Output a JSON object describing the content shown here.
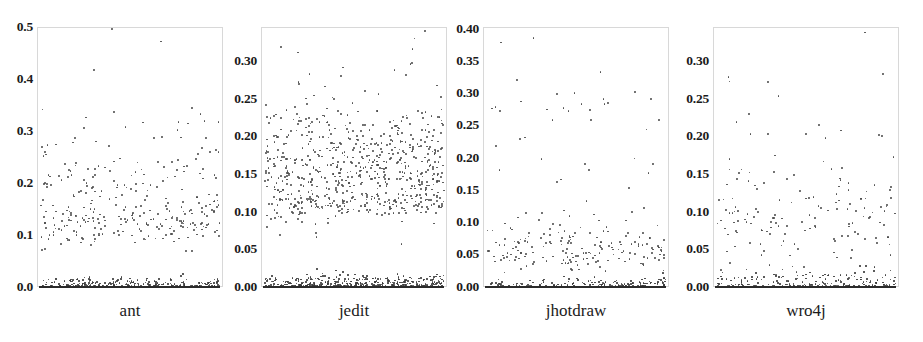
{
  "figure": {
    "background_color": "#ffffff",
    "dot_color": "#4a4a4a",
    "frame_color": "#d8d8d8",
    "width": 923,
    "height": 342
  },
  "chart_data": [
    {
      "type": "scatter",
      "title": "ant",
      "xlabel": "ant",
      "ylabel": "",
      "grid": false,
      "legend": null,
      "ylim": [
        0.0,
        0.5
      ],
      "yticks": [
        "0.0",
        "0.1",
        "0.2",
        "0.3",
        "0.4",
        "0.5"
      ],
      "ytick_values": [
        0.0,
        0.1,
        0.2,
        0.3,
        0.4,
        0.5
      ],
      "xlim": [
        0,
        1
      ],
      "xticks": [],
      "n_points": 640,
      "description": "Dense band of points near y=0.00 spanning full width, a secondary band around y=0.11-0.14, scattered points from 0.15 to 0.30, outliers at 0.35 and 0.49",
      "clusters": [
        {
          "center_y": 0.004,
          "spread_y": 0.008,
          "count": 330,
          "note": "zero baseline band"
        },
        {
          "center_y": 0.125,
          "spread_y": 0.022,
          "count": 160,
          "note": "mid band"
        },
        {
          "center_y": 0.2,
          "spread_y": 0.045,
          "count": 120,
          "note": "upper scatter"
        },
        {
          "center_y": 0.29,
          "spread_y": 0.035,
          "count": 22,
          "note": "sparse upper"
        },
        {
          "center_y": 0.42,
          "spread_y": 0.07,
          "count": 3,
          "note": "outliers"
        }
      ],
      "max_value": 0.49
    },
    {
      "type": "scatter",
      "title": "jedit",
      "xlabel": "jedit",
      "ylabel": "",
      "grid": false,
      "legend": null,
      "ylim": [
        0.0,
        0.33
      ],
      "yticks": [
        "0.00",
        "0.05",
        "0.10",
        "0.15",
        "0.20",
        "0.25",
        "0.30"
      ],
      "ytick_values": [
        0.0,
        0.05,
        0.1,
        0.15,
        0.2,
        0.25,
        0.3
      ],
      "xlim": [
        0,
        1
      ],
      "xticks": [],
      "n_points": 1150,
      "description": "Very dense baseline at y=0.00, heavy cloud from 0.08 to 0.21 centered near 0.145, a dense sub-band at 0.105, sparse outliers to 0.32",
      "clusters": [
        {
          "center_y": 0.004,
          "spread_y": 0.006,
          "count": 430,
          "note": "zero baseline band"
        },
        {
          "center_y": 0.105,
          "spread_y": 0.008,
          "count": 150,
          "note": "dense lower band"
        },
        {
          "center_y": 0.148,
          "spread_y": 0.028,
          "count": 440,
          "note": "main cloud"
        },
        {
          "center_y": 0.2,
          "spread_y": 0.022,
          "count": 110,
          "note": "upper cloud"
        },
        {
          "center_y": 0.26,
          "spread_y": 0.035,
          "count": 18,
          "note": "sparse upper"
        },
        {
          "center_y": 0.315,
          "spread_y": 0.01,
          "count": 3,
          "note": "outliers"
        }
      ],
      "max_value": 0.325
    },
    {
      "type": "scatter",
      "title": "jhotdraw",
      "xlabel": "jhotdraw",
      "ylabel": "",
      "grid": false,
      "legend": null,
      "ylim": [
        0.0,
        0.4
      ],
      "yticks": [
        "0.00",
        "0.05",
        "0.10",
        "0.15",
        "0.20",
        "0.25",
        "0.30",
        "0.35",
        "0.40"
      ],
      "ytick_values": [
        0.0,
        0.05,
        0.1,
        0.15,
        0.2,
        0.25,
        0.3,
        0.35,
        0.4
      ],
      "xlim": [
        0,
        1
      ],
      "xticks": [],
      "n_points": 420,
      "description": "Dense baseline at y=0.00, mid cloud between 0.03 and 0.09 centered near 0.055, sparse points 0.10-0.30, outliers at 0.35 and 0.39",
      "clusters": [
        {
          "center_y": 0.003,
          "spread_y": 0.006,
          "count": 200,
          "note": "zero baseline band"
        },
        {
          "center_y": 0.055,
          "spread_y": 0.016,
          "count": 155,
          "note": "main cloud"
        },
        {
          "center_y": 0.1,
          "spread_y": 0.018,
          "count": 25,
          "note": "sparse mid"
        },
        {
          "center_y": 0.2,
          "spread_y": 0.05,
          "count": 20,
          "note": "sparse upper"
        },
        {
          "center_y": 0.285,
          "spread_y": 0.03,
          "count": 18,
          "note": "sparse top"
        },
        {
          "center_y": 0.37,
          "spread_y": 0.02,
          "count": 2,
          "note": "outliers"
        }
      ],
      "max_value": 0.39
    },
    {
      "type": "scatter",
      "title": "wro4j",
      "xlabel": "wro4j",
      "ylabel": "",
      "grid": false,
      "legend": null,
      "ylim": [
        0.0,
        0.33
      ],
      "yticks": [
        "0.00",
        "0.05",
        "0.10",
        "0.15",
        "0.20",
        "0.25",
        "0.30"
      ],
      "ytick_values": [
        0.0,
        0.05,
        0.1,
        0.15,
        0.2,
        0.25,
        0.3
      ],
      "xlim": [
        0,
        1
      ],
      "xticks": [],
      "n_points": 430,
      "description": "Dense baseline at y=0.00 with fuzz up to 0.02, scattered cloud 0.04-0.11, sparse points 0.12-0.23, outliers at 0.26 and 0.32",
      "clusters": [
        {
          "center_y": 0.004,
          "spread_y": 0.009,
          "count": 230,
          "note": "zero baseline band"
        },
        {
          "center_y": 0.075,
          "spread_y": 0.025,
          "count": 105,
          "note": "main cloud"
        },
        {
          "center_y": 0.125,
          "spread_y": 0.025,
          "count": 30,
          "note": "sparse mid"
        },
        {
          "center_y": 0.185,
          "spread_y": 0.03,
          "count": 18,
          "note": "sparse upper"
        },
        {
          "center_y": 0.255,
          "spread_y": 0.02,
          "count": 5,
          "note": "sparse top"
        },
        {
          "center_y": 0.315,
          "spread_y": 0.008,
          "count": 1,
          "note": "outlier"
        }
      ],
      "max_value": 0.32
    }
  ],
  "panels": [
    {
      "id": "ant",
      "label": "ant",
      "frame": {
        "left": 37,
        "top": 27,
        "width": 186,
        "height": 260
      },
      "label_x": 130,
      "label_y": 303,
      "tick_label_right": 33,
      "ticks": [
        {
          "text": "0.5",
          "y": 27
        },
        {
          "text": "0.4",
          "y": 79
        },
        {
          "text": "0.3",
          "y": 131
        },
        {
          "text": "0.2",
          "y": 183
        },
        {
          "text": "0.1",
          "y": 235
        },
        {
          "text": "0.0",
          "y": 287
        }
      ]
    },
    {
      "id": "jedit",
      "label": "jedit",
      "frame": {
        "left": 261,
        "top": 27,
        "width": 186,
        "height": 260
      },
      "label_x": 354,
      "label_y": 303,
      "tick_label_right": 257,
      "ticks": [
        {
          "text": "0.30",
          "y": 61
        },
        {
          "text": "0.25",
          "y": 99
        },
        {
          "text": "0.20",
          "y": 136
        },
        {
          "text": "0.15",
          "y": 174
        },
        {
          "text": "0.10",
          "y": 212
        },
        {
          "text": "0.05",
          "y": 249
        },
        {
          "text": "0.00",
          "y": 287
        }
      ]
    },
    {
      "id": "jhotdraw",
      "label": "jhotdraw",
      "frame": {
        "left": 483,
        "top": 27,
        "width": 186,
        "height": 260
      },
      "label_x": 576,
      "label_y": 303,
      "tick_label_right": 479,
      "ticks": [
        {
          "text": "0.40",
          "y": 29
        },
        {
          "text": "0.35",
          "y": 61
        },
        {
          "text": "0.30",
          "y": 93
        },
        {
          "text": "0.25",
          "y": 125
        },
        {
          "text": "0.20",
          "y": 158
        },
        {
          "text": "0.15",
          "y": 190
        },
        {
          "text": "0.10",
          "y": 222
        },
        {
          "text": "0.05",
          "y": 254
        },
        {
          "text": "0.00",
          "y": 287
        }
      ]
    },
    {
      "id": "wro4j",
      "label": "wro4j",
      "frame": {
        "left": 713,
        "top": 27,
        "width": 186,
        "height": 260
      },
      "label_x": 806,
      "label_y": 303,
      "tick_label_right": 709,
      "ticks": [
        {
          "text": "0.30",
          "y": 61
        },
        {
          "text": "0.25",
          "y": 99
        },
        {
          "text": "0.20",
          "y": 136
        },
        {
          "text": "0.15",
          "y": 174
        },
        {
          "text": "0.10",
          "y": 212
        },
        {
          "text": "0.05",
          "y": 249
        },
        {
          "text": "0.00",
          "y": 287
        }
      ]
    }
  ]
}
